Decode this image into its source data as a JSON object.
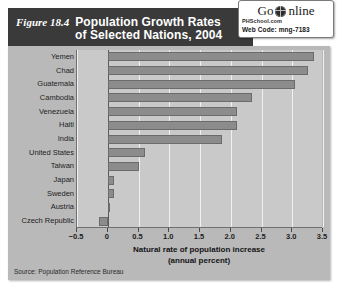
{
  "figure": {
    "number_label": "Figure 18.4",
    "title_line1": "Population Growth Rates",
    "title_line2": "of Selected Nations, 2004",
    "source": "Source: Population Reference Bureau"
  },
  "go_online": {
    "go": "Go",
    "online": "nline",
    "globe_icon": "globe-icon",
    "site": "PHSchool.com",
    "web_code": "Web Code: mng-7183"
  },
  "colors": {
    "title_bar": "#3a3a3a",
    "panel": "#b9b9b9",
    "plot_background": "#c9c9c9",
    "bar_fill": "#8c8c8c",
    "bar_border": "#6b6b6b",
    "gridline": "#f0f0f0",
    "axis": "#5a5a5a",
    "text": "#1d1d1d"
  },
  "chart_data": {
    "type": "bar",
    "orientation": "horizontal",
    "title": "Population Growth Rates of Selected Nations, 2004",
    "xlabel": "Natural rate of population increase (annual percent)",
    "xlabel_line1": "Natural rate of population increase",
    "xlabel_line2": "(annual percent)",
    "ylabel": "",
    "xlim": [
      -0.5,
      3.5
    ],
    "xticks": [
      -0.5,
      0,
      0.5,
      1.0,
      1.5,
      2.0,
      2.5,
      3.0,
      3.5
    ],
    "xticklabels": [
      "−0.5",
      "0",
      "0.5",
      "1.0",
      "1.5",
      "2.0",
      "2.5",
      "3.0",
      "3.5"
    ],
    "grid": true,
    "legend": false,
    "categories": [
      "Yemen",
      "Chad",
      "Guatemala",
      "Cambodia",
      "Venezuela",
      "Haiti",
      "India",
      "United States",
      "Taiwan",
      "Japan",
      "Sweden",
      "Austria",
      "Czech Republic"
    ],
    "values": [
      3.35,
      3.25,
      3.05,
      2.35,
      2.1,
      2.1,
      1.85,
      0.6,
      0.5,
      0.1,
      0.1,
      0.02,
      -0.15
    ],
    "source": "Population Reference Bureau"
  }
}
